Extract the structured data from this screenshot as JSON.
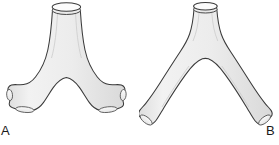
{
  "figure": {
    "background_color": "#ffffff",
    "width": 279,
    "height": 145
  },
  "style": {
    "fill_color": "#e9e9e9",
    "fill_color_light": "#f2f2f2",
    "fill_color_shade": "#dcdcdc",
    "outline_color": "#3a3a3a",
    "lumen_fill": "#f7f7f7",
    "lumen_outline": "#555555",
    "label_color": "#1a1a1a"
  },
  "panels": [
    {
      "id": "a",
      "label": "A",
      "structure_name": "trachea-with-wide-bifurcation",
      "description": "Trachea descending to a widely splayed, nearly horizontal bifurcation with short lobed main bronchi and open cut ends",
      "parts": [
        {
          "name": "tracheal-lumen-opening",
          "shape": "ellipse"
        },
        {
          "name": "trachea-shaft",
          "shape": "tube"
        },
        {
          "name": "carina",
          "shape": "apex"
        },
        {
          "name": "left-main-bronchus",
          "shape": "branch"
        },
        {
          "name": "right-main-bronchus",
          "shape": "branch"
        },
        {
          "name": "left-bronchus-cut-end",
          "shape": "ellipse"
        },
        {
          "name": "right-bronchus-cut-end",
          "shape": "ellipse"
        },
        {
          "name": "left-lower-lobe-stub",
          "shape": "ellipse"
        },
        {
          "name": "right-lower-lobe-stub",
          "shape": "ellipse"
        }
      ]
    },
    {
      "id": "b",
      "label": "B",
      "structure_name": "trachea-with-narrow-bifurcation",
      "description": "Trachea descending to a narrow steep inverted-V bifurcation with long obliquely descending main bronchi and flared cut ends",
      "parts": [
        {
          "name": "tracheal-lumen-opening",
          "shape": "ellipse"
        },
        {
          "name": "trachea-shaft",
          "shape": "tube"
        },
        {
          "name": "carina",
          "shape": "apex"
        },
        {
          "name": "left-main-bronchus",
          "shape": "branch"
        },
        {
          "name": "right-main-bronchus",
          "shape": "branch"
        },
        {
          "name": "left-bronchus-cut-end",
          "shape": "ellipse"
        },
        {
          "name": "right-bronchus-cut-end",
          "shape": "ellipse"
        }
      ]
    }
  ]
}
